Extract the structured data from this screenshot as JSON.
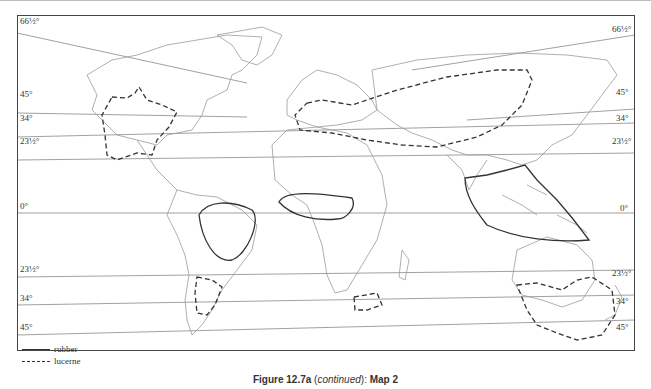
{
  "figure": {
    "caption_prefix": "Figure 12.7a",
    "caption_italic": "continued",
    "caption_suffix": "Map 2",
    "caption_full": "Figure 12.7a (continued): Map 2"
  },
  "map": {
    "type": "world outline map",
    "latitude_labels_left": [
      "66½°",
      "45°",
      "34°",
      "23½°",
      "0°",
      "23½°",
      "34°",
      "45°"
    ],
    "latitude_labels_right": [
      "66½°",
      "45°",
      "34°",
      "23½°",
      "0°",
      "23½°",
      "34°",
      "45°"
    ],
    "regions": {
      "rubber": [
        "northern South America (Amazon basin)",
        "West Africa (Guinea coast)",
        "South-east Asia (Indochina, Malaysia, Indonesia)"
      ],
      "lucerne": [
        "USA",
        "Europe and central Asia",
        "southern South America (Argentina/Uruguay)",
        "South Africa",
        "south-east Australia and New Zealand"
      ]
    }
  },
  "legend": {
    "items": [
      {
        "label": "rubber",
        "style": "solid"
      },
      {
        "label": "lucerne",
        "style": "dashed"
      }
    ]
  },
  "colors": {
    "line": "#333333",
    "land_outline": "#9a9a9a",
    "background": "#ffffff"
  }
}
